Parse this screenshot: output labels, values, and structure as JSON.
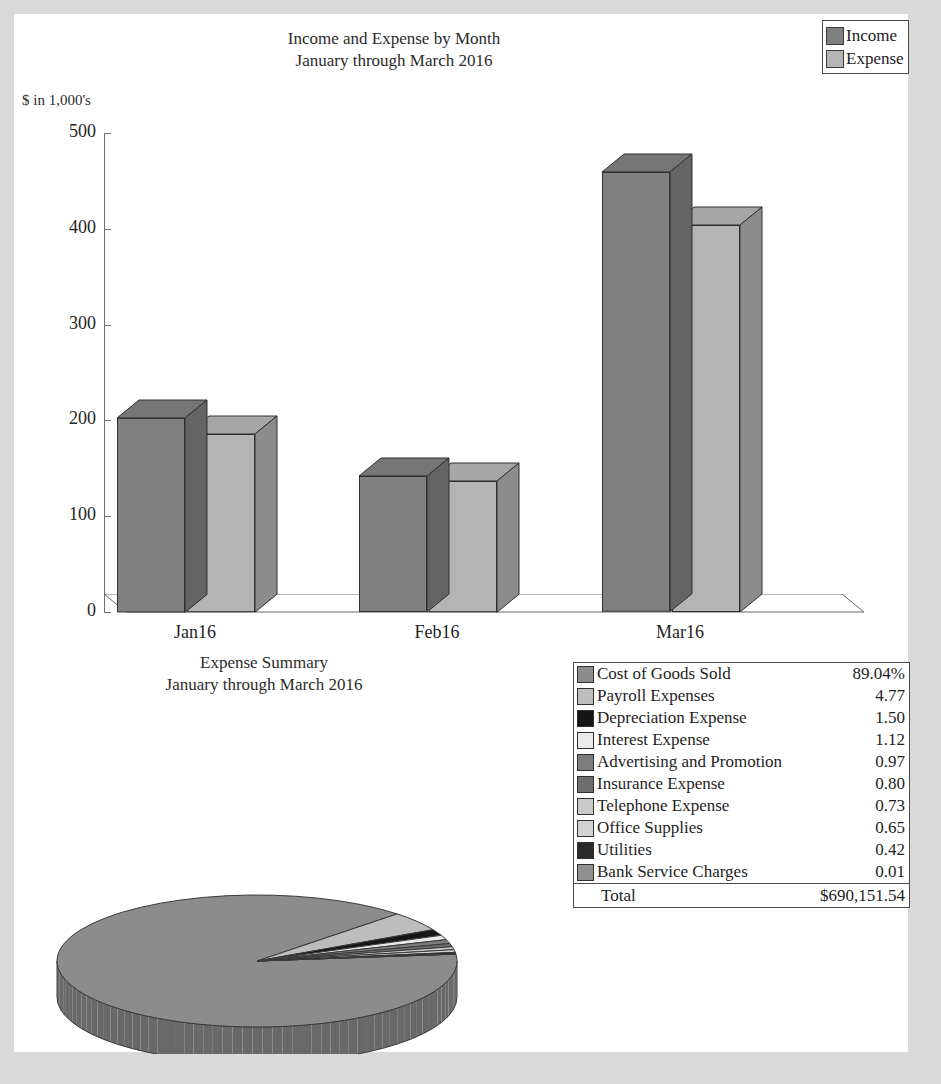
{
  "bar_chart": {
    "title_line1": "Income and Expense by Month",
    "title_line2": "January through March 2016",
    "axis_unit": "$ in 1,000's",
    "legend": [
      {
        "label": "Income",
        "color": "#808080"
      },
      {
        "label": "Expense",
        "color": "#b4b4b4"
      }
    ]
  },
  "pie_section": {
    "title_line1": "Expense Summary",
    "title_line2": "January through March 2016",
    "total_label": "Total",
    "total_value": "$690,151.54"
  },
  "chart_data": [
    {
      "type": "bar",
      "title": "Income and Expense by Month\nJanuary through March 2016",
      "xlabel": "",
      "ylabel": "$ in 1,000's",
      "ylim": [
        0,
        500
      ],
      "yticks": [
        0,
        100,
        200,
        300,
        400,
        500
      ],
      "ytick_labels": [
        "0",
        "100",
        "200",
        "300",
        "400",
        "500"
      ],
      "categories": [
        "Jan16",
        "Feb16",
        "Mar16"
      ],
      "grid": false,
      "legend_position": "top-right",
      "three_d": true,
      "series": [
        {
          "name": "Income",
          "color": "#808080",
          "values": [
            203,
            142,
            459
          ]
        },
        {
          "name": "Expense",
          "color": "#b4b4b4",
          "values": [
            186,
            137,
            404
          ]
        }
      ]
    },
    {
      "type": "pie",
      "title": "Expense Summary\nJanuary through March 2016",
      "three_d": true,
      "value_suffix": "%",
      "total_label": "Total",
      "total_value": "$690,151.54",
      "labels": [
        "Cost of Goods Sold",
        "Payroll Expenses",
        "Depreciation Expense",
        "Interest Expense",
        "Advertising and Promotion",
        "Insurance Expense",
        "Telephone Expense",
        "Office Supplies",
        "Utilities",
        "Bank Service Charges"
      ],
      "values": [
        89.04,
        4.77,
        1.5,
        1.12,
        0.97,
        0.8,
        0.73,
        0.65,
        0.42,
        0.01
      ],
      "value_labels": [
        "89.04%",
        "4.77",
        "1.50",
        "1.12",
        "0.97",
        "0.80",
        "0.73",
        "0.65",
        "0.42",
        "0.01"
      ],
      "colors": [
        "#8c8c8c",
        "#bdbdbd",
        "#161616",
        "#eaeaea",
        "#7d7d7d",
        "#6e6e6e",
        "#c9c9c9",
        "#d2d2d2",
        "#2a2a2a",
        "#909090"
      ],
      "slices": [
        {
          "label": "Cost of Goods Sold",
          "value": 89.04,
          "display": "89.04%",
          "color": "#8c8c8c"
        },
        {
          "label": "Payroll Expenses",
          "value": 4.77,
          "display": "4.77",
          "color": "#bdbdbd"
        },
        {
          "label": "Depreciation Expense",
          "value": 1.5,
          "display": "1.50",
          "color": "#161616"
        },
        {
          "label": "Interest Expense",
          "value": 1.12,
          "display": "1.12",
          "color": "#eaeaea"
        },
        {
          "label": "Advertising and Promotion",
          "value": 0.97,
          "display": "0.97",
          "color": "#7d7d7d"
        },
        {
          "label": "Insurance Expense",
          "value": 0.8,
          "display": "0.80",
          "color": "#6e6e6e"
        },
        {
          "label": "Telephone Expense",
          "value": 0.73,
          "display": "0.73",
          "color": "#c9c9c9"
        },
        {
          "label": "Office Supplies",
          "value": 0.65,
          "display": "0.65",
          "color": "#d2d2d2"
        },
        {
          "label": "Utilities",
          "value": 0.42,
          "display": "0.42",
          "color": "#2a2a2a"
        },
        {
          "label": "Bank Service Charges",
          "value": 0.01,
          "display": "0.01",
          "color": "#909090"
        }
      ]
    }
  ]
}
